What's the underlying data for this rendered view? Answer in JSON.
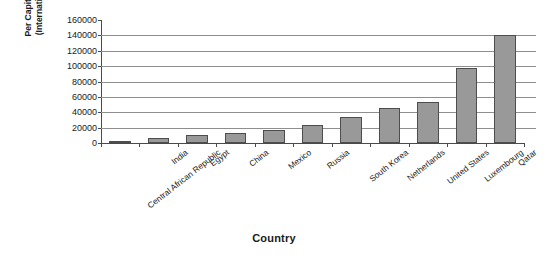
{
  "chart_data": {
    "type": "bar",
    "title": "",
    "xlabel": "Country",
    "ylabel_line1": "Per Capita Current GDP 2015",
    "ylabel_line2": "(International dollars at ppp)",
    "categories": [
      "Central African Republic",
      "India",
      "Egypt",
      "China",
      "Mexico",
      "Russia",
      "South Korea",
      "Netherlands",
      "United States",
      "Luxembourg",
      "Qatar"
    ],
    "values": [
      1600,
      6200,
      11000,
      13500,
      17000,
      23000,
      34000,
      46000,
      54000,
      98000,
      141000
    ],
    "ylim": [
      0,
      160000
    ],
    "ytick_values": [
      0,
      20000,
      40000,
      60000,
      80000,
      100000,
      120000,
      140000,
      160000
    ],
    "ytick_labels": [
      "0",
      "20000",
      "40000",
      "60000",
      "80000",
      "100000",
      "120000",
      "140000",
      "160000"
    ],
    "grid": true,
    "legend": false,
    "bar_color": "#999999",
    "bar_edge_color": "#4d4d4d",
    "grid_color": "#8e8e8e",
    "axis_color": "#4a4a4a",
    "background_color": "#ffffff"
  }
}
